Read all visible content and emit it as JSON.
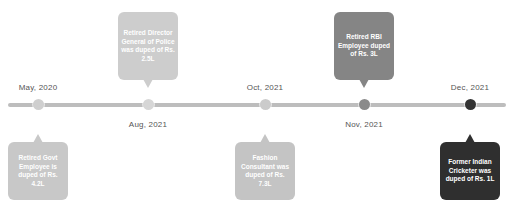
{
  "timeline": {
    "line_color": "#bdbdbd",
    "events": [
      {
        "date": "May, 2020",
        "date_position": "above",
        "callout_position": "below",
        "text": "Retired Govt Employee is duped of Rs. 4.2L",
        "color": "#c8c8c8",
        "dot_color": "#cfcfcf",
        "x": 38
      },
      {
        "date": "Aug, 2021",
        "date_position": "below",
        "callout_position": "above",
        "text": "Retired Director General of Police was duped of Rs. 2.5L",
        "color": "#cdcdcd",
        "dot_color": "#d6d6d6",
        "x": 148
      },
      {
        "date": "Oct, 2021",
        "date_position": "above",
        "callout_position": "below",
        "text": "Fashion Consultant was duped of Rs. 7.3L",
        "color": "#c4c4c4",
        "dot_color": "#cbcbcb",
        "x": 265
      },
      {
        "date": "Nov, 2021",
        "date_position": "below",
        "callout_position": "above",
        "text": "Retired RBI Employee duped of Rs. 3L",
        "color": "#858585",
        "dot_color": "#8a8a8a",
        "x": 364
      },
      {
        "date": "Dec, 2021",
        "date_position": "above",
        "callout_position": "below",
        "text": "Former Indian Cricketer was duped of Rs. 1L",
        "color": "#2f2f2f",
        "dot_color": "#333333",
        "x": 470
      }
    ]
  }
}
